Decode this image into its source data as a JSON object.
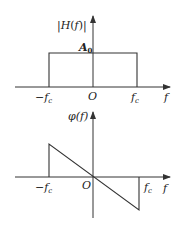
{
  "figure": {
    "top_plot": {
      "ylabel": "|H(f)|",
      "xlabel": "f",
      "level_label": "A",
      "level_sub": "0",
      "tick_left": "−f",
      "tick_left_sub": "c",
      "origin": "O",
      "tick_right": "f",
      "tick_right_sub": "c",
      "description": "Ideal low-pass amplitude response: constant A0 between −fc and fc, zero elsewhere"
    },
    "bottom_plot": {
      "ylabel": "φ(f)",
      "xlabel": "f",
      "tick_left": "−f",
      "tick_left_sub": "c",
      "origin": "O",
      "tick_right": "f",
      "tick_right_sub": "c",
      "description": "Linear phase response: line through origin with negative slope between −fc and fc"
    }
  }
}
